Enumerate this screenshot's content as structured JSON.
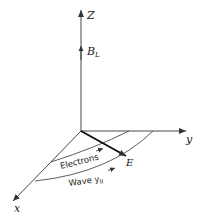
{
  "diagram": {
    "axes": {
      "z_label": "Z",
      "y_label": "y",
      "x_label": "x"
    },
    "vectors": {
      "field_label": "B",
      "field_subscript": "L",
      "e_label": "E"
    },
    "arcs": {
      "electrons_label": "Electrons",
      "wave_label": "Wave y",
      "wave_subscript": "II"
    },
    "colors": {
      "line": "#333333",
      "text": "#222222"
    }
  }
}
